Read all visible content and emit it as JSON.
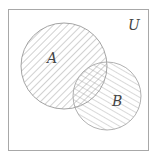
{
  "diagram": {
    "type": "venn",
    "universe_label": "U",
    "sets": [
      {
        "label": "A",
        "hatch": "diagonal-down",
        "shaded": true
      },
      {
        "label": "B",
        "hatch": "diagonal-up",
        "shaded": true
      }
    ],
    "intersection": {
      "hatch": "cross-hatch"
    },
    "colors": {
      "stroke": "#9a9a9a",
      "hatch": "#8c8c8c",
      "text": "#444444"
    }
  }
}
